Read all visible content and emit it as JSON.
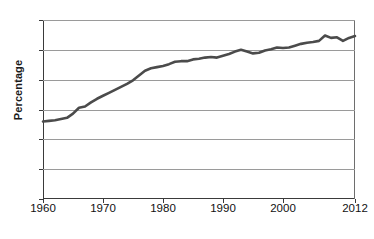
{
  "chart_data": {
    "type": "line",
    "title": "",
    "xlabel": "",
    "ylabel": "Percentage",
    "xlim": [
      1960,
      2012
    ],
    "ylim": [
      0,
      30
    ],
    "grid": true,
    "legend": false,
    "series_color": "#4b4b4b",
    "axis_color": "#3a3a3a",
    "grid_color": "#9a9a9a",
    "ytick_labels": [
      "30",
      "25",
      "20",
      "15",
      "10",
      "5",
      "0"
    ],
    "ytick_values": [
      30,
      25,
      20,
      15,
      10,
      5,
      0
    ],
    "xtick_labels": [
      "1960",
      "1970",
      "1980",
      "1990",
      "2000",
      "2012"
    ],
    "xtick_values": [
      1960,
      1970,
      1980,
      1990,
      2000,
      2012
    ],
    "x": [
      1960,
      1961,
      1962,
      1963,
      1964,
      1965,
      1966,
      1967,
      1968,
      1969,
      1970,
      1971,
      1972,
      1973,
      1974,
      1975,
      1976,
      1977,
      1978,
      1979,
      1980,
      1981,
      1982,
      1983,
      1984,
      1985,
      1986,
      1987,
      1988,
      1989,
      1990,
      1991,
      1992,
      1993,
      1994,
      1995,
      1996,
      1997,
      1998,
      1999,
      2000,
      2001,
      2002,
      2003,
      2004,
      2005,
      2006,
      2007,
      2008,
      2009,
      2010,
      2011,
      2012
    ],
    "values": [
      13.0,
      13.1,
      13.2,
      13.4,
      13.6,
      14.3,
      15.3,
      15.5,
      16.2,
      16.8,
      17.3,
      17.8,
      18.3,
      18.8,
      19.3,
      19.9,
      20.7,
      21.5,
      21.9,
      22.1,
      22.3,
      22.6,
      23.0,
      23.1,
      23.1,
      23.4,
      23.5,
      23.7,
      23.8,
      23.7,
      24.0,
      24.3,
      24.7,
      25.0,
      24.7,
      24.4,
      24.5,
      24.9,
      25.1,
      25.4,
      25.3,
      25.4,
      25.7,
      26.0,
      26.2,
      26.3,
      26.5,
      27.4,
      27.0,
      27.1,
      26.5,
      27.0,
      27.3
    ],
    "series": [
      {
        "name": "Percentage",
        "values": [
          13.0,
          13.1,
          13.2,
          13.4,
          13.6,
          14.3,
          15.3,
          15.5,
          16.2,
          16.8,
          17.3,
          17.8,
          18.3,
          18.8,
          19.3,
          19.9,
          20.7,
          21.5,
          21.9,
          22.1,
          22.3,
          22.6,
          23.0,
          23.1,
          23.1,
          23.4,
          23.5,
          23.7,
          23.8,
          23.7,
          24.0,
          24.3,
          24.7,
          25.0,
          24.7,
          24.4,
          24.5,
          24.9,
          25.1,
          25.4,
          25.3,
          25.4,
          25.7,
          26.0,
          26.2,
          26.3,
          26.5,
          27.4,
          27.0,
          27.1,
          26.5,
          27.0,
          27.3
        ]
      }
    ]
  }
}
